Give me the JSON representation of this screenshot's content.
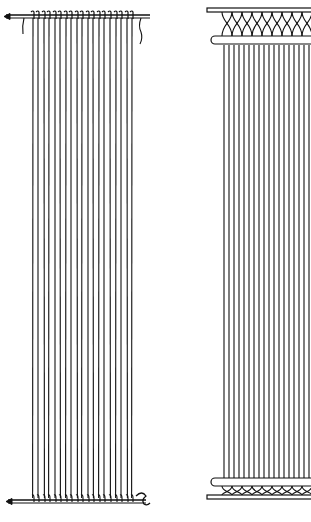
{
  "figure": {
    "colors": {
      "ink": "#111111",
      "paper": "#ffffff"
    },
    "left_panel": {
      "label": "warp-on-rods",
      "top_rod_y": 15,
      "bottom_rod_y": 500,
      "thread_x": [
        33,
        38,
        44,
        49,
        55,
        60,
        66,
        71,
        77,
        82,
        88,
        93,
        99,
        104,
        110,
        116,
        121,
        127,
        132
      ],
      "thread_top": 18,
      "thread_bottom": 498
    },
    "right_panel": {
      "label": "warp-with-looped-headings",
      "top_bar_y": 10,
      "top_rod_y": 40,
      "bottom_rod_y": 482,
      "bottom_bar_y": 497,
      "thread_x": [
        224,
        229,
        234,
        239,
        244,
        249,
        254,
        259,
        264,
        269,
        274,
        279,
        284,
        289,
        294,
        299,
        304,
        309
      ],
      "thread_top": 45,
      "thread_bottom": 478
    }
  }
}
